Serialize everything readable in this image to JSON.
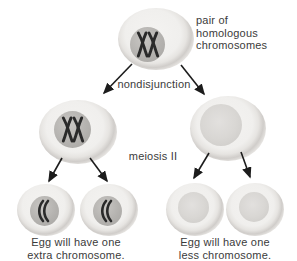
{
  "labels": {
    "pair_of_homologous": "pair of\nhomologous\nchromosomes",
    "nondisjunction": "nondisjunction",
    "meiosis_ii": "meiosis II",
    "egg_extra": "Egg will have one\nextra chromosome.",
    "egg_less": "Egg will have one\nless chromosome."
  },
  "colors": {
    "background": "#ffffff",
    "cell_ring": "#cfccc9",
    "cell_body": "#f0efed",
    "nucleus": "#b4b2af",
    "nucleus_faint": "#d9d7d4",
    "chromosome": "#2a2a2a",
    "arrow": "#1c1c1c",
    "text": "#3b3b3b"
  },
  "cells": [
    {
      "id": "parent-cell",
      "row": "top",
      "contents": "pair of homologous chromosomes"
    },
    {
      "id": "meiosis1-left-cell",
      "row": "middle",
      "contents": "both homologous chromosomes (nondisjunction)"
    },
    {
      "id": "meiosis1-right-cell",
      "row": "middle",
      "contents": "no chromosomes"
    },
    {
      "id": "egg-extra-1",
      "row": "bottom",
      "contents": "one extra chromosome"
    },
    {
      "id": "egg-extra-2",
      "row": "bottom",
      "contents": "one extra chromosome"
    },
    {
      "id": "egg-less-1",
      "row": "bottom",
      "contents": "one less chromosome"
    },
    {
      "id": "egg-less-2",
      "row": "bottom",
      "contents": "one less chromosome"
    }
  ]
}
